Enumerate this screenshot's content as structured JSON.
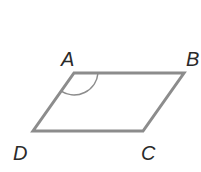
{
  "figure": {
    "shape": "parallelogram",
    "vertices": [
      {
        "label": "A",
        "x": 74,
        "y": 73
      },
      {
        "label": "B",
        "x": 184,
        "y": 73
      },
      {
        "label": "C",
        "x": 143,
        "y": 131
      },
      {
        "label": "D",
        "x": 33,
        "y": 131
      }
    ],
    "marked_angle": "A",
    "stroke_color": "#8c8c8c",
    "label_color": "#2a2a2a"
  },
  "labels": {
    "a": "A",
    "b": "B",
    "c": "C",
    "d": "D"
  }
}
